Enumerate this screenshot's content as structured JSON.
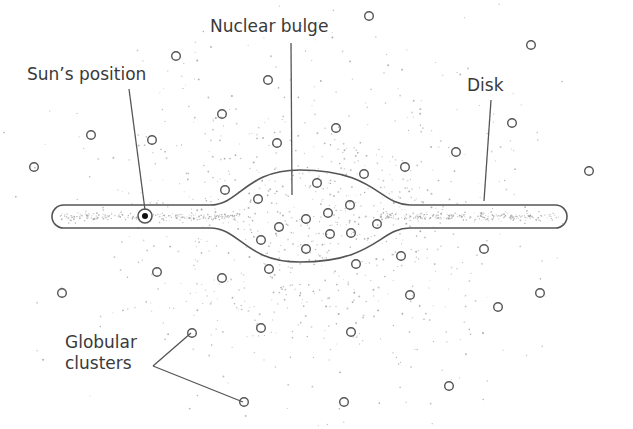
{
  "labels": {
    "nuclear_bulge": "Nuclear bulge",
    "sun_position": "Sun’s position",
    "disk": "Disk",
    "globular_clusters": "Globular\nclusters"
  },
  "label_positions": {
    "nuclear_bulge": {
      "x": 210,
      "y": 18
    },
    "sun_position": {
      "x": 27,
      "y": 66
    },
    "disk": {
      "x": 467,
      "y": 77
    },
    "globular_clusters": {
      "x": 65,
      "y": 332
    }
  },
  "colors": {
    "line": "#555555",
    "text": "#3a3a3a",
    "stars": "#9a9a9a",
    "sun": "#111111",
    "background": "#ffffff"
  },
  "galaxy": {
    "disk": {
      "x_left": 52,
      "x_right": 567,
      "y_top": 205,
      "y_bottom": 228
    },
    "bulge": {
      "cx": 310,
      "top": 170,
      "bottom": 262,
      "half_width": 80
    },
    "sun": {
      "x": 145,
      "y": 216
    }
  },
  "leaders": [
    {
      "name": "nuclear-bulge-leader",
      "points": [
        [
          291,
          43
        ],
        [
          292,
          195
        ]
      ]
    },
    {
      "name": "sun-leader",
      "points": [
        [
          129,
          89
        ],
        [
          145,
          210
        ]
      ]
    },
    {
      "name": "disk-leader",
      "points": [
        [
          491,
          100
        ],
        [
          484,
          201
        ]
      ]
    },
    {
      "name": "globular-leader-top",
      "points": [
        [
          153,
          366
        ],
        [
          191,
          333
        ]
      ]
    },
    {
      "name": "globular-leader-bottom",
      "points": [
        [
          153,
          366
        ],
        [
          243,
          402
        ]
      ]
    }
  ],
  "globular_clusters": [
    [
      369,
      16
    ],
    [
      531,
      45
    ],
    [
      176,
      56
    ],
    [
      268,
      80
    ],
    [
      222,
      114
    ],
    [
      512,
      123
    ],
    [
      91,
      135
    ],
    [
      152,
      140
    ],
    [
      336,
      128
    ],
    [
      277,
      143
    ],
    [
      456,
      152
    ],
    [
      34,
      167
    ],
    [
      405,
      167
    ],
    [
      589,
      171
    ],
    [
      364,
      174
    ],
    [
      317,
      183
    ],
    [
      225,
      190
    ],
    [
      258,
      199
    ],
    [
      261,
      240
    ],
    [
      279,
      227
    ],
    [
      306,
      219
    ],
    [
      328,
      213
    ],
    [
      350,
      205
    ],
    [
      377,
      224
    ],
    [
      330,
      234
    ],
    [
      351,
      233
    ],
    [
      306,
      249
    ],
    [
      401,
      256
    ],
    [
      157,
      272
    ],
    [
      222,
      278
    ],
    [
      269,
      269
    ],
    [
      356,
      264
    ],
    [
      484,
      249
    ],
    [
      410,
      295
    ],
    [
      62,
      293
    ],
    [
      498,
      307
    ],
    [
      540,
      293
    ],
    [
      192,
      333
    ],
    [
      261,
      328
    ],
    [
      351,
      332
    ],
    [
      449,
      386
    ],
    [
      244,
      402
    ],
    [
      344,
      402
    ]
  ],
  "star_field": {
    "count": 900,
    "center": {
      "x": 312,
      "y": 216
    },
    "spread_x": 105,
    "spread_y": 80
  }
}
